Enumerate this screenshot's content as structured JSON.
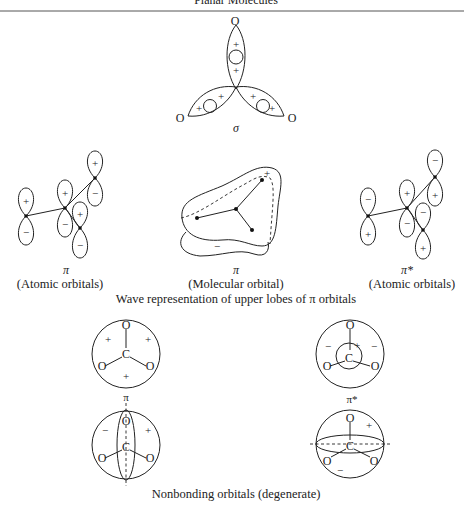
{
  "header": {
    "running_title": "Planar Molecules"
  },
  "sigma_diagram": {
    "label": "σ",
    "atoms": [
      "O",
      "O",
      "O"
    ],
    "signs": [
      "+",
      "+",
      "+",
      "+",
      "+",
      "+"
    ]
  },
  "pi_atomic": {
    "symbol": "π",
    "caption": "(Atomic orbitals)",
    "upper_signs": [
      "+",
      "+",
      "+",
      "+"
    ],
    "lower_signs": [
      "−",
      "−",
      "−",
      "−"
    ]
  },
  "pi_molecular": {
    "symbol": "π",
    "caption": "(Molecular orbital)",
    "upper_sign": "+",
    "lower_sign": "−"
  },
  "pi_star_atomic": {
    "symbol": "π*",
    "caption": "(Atomic orbitals)",
    "upper_signs": [
      "−",
      "+",
      "−",
      "−"
    ],
    "lower_signs": [
      "+",
      "−",
      "+",
      "+"
    ]
  },
  "wave_caption": "Wave representation of upper lobes of π orbitals",
  "nonbonding": {
    "pi": {
      "symbol": "π",
      "top": {
        "atoms": {
          "top": "O",
          "center": "C",
          "left": "O",
          "right": "O"
        },
        "signs": [
          "+",
          "+",
          "+"
        ]
      },
      "bottom": {
        "atoms": {
          "top": "O",
          "center": "C",
          "left": "O",
          "right": "O"
        },
        "signs": [
          "−",
          "+"
        ]
      }
    },
    "pi_star": {
      "symbol": "π*",
      "top": {
        "atoms": {
          "top": "O",
          "center": "C",
          "left": "O",
          "right": "O"
        },
        "signs": [
          "−",
          "−",
          "+"
        ]
      },
      "bottom": {
        "atoms": {
          "top": "O",
          "center": "C",
          "left": "O",
          "right": "O"
        },
        "signs": [
          "+",
          "−"
        ]
      }
    },
    "caption": "Nonbonding orbitals (degenerate)"
  }
}
